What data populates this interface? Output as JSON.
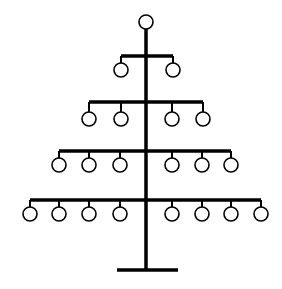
{
  "diagram": {
    "title": "",
    "colors": {
      "line": "#000000",
      "node_fill": "#ffffff",
      "background": "#ffffff"
    },
    "trunk": {
      "x": 146,
      "y_top": 29,
      "y_bottom": 270,
      "width": 3.5
    },
    "base": {
      "x1": 117,
      "x2": 178,
      "y": 270,
      "width": 3.5
    },
    "node_radius": 7,
    "stub_width": 2,
    "bar_width": 3.5,
    "root": {
      "x": 146,
      "y": 22
    },
    "tiers": [
      {
        "name": "tier-1",
        "bar_y": 56,
        "node_y": 70,
        "nodes_x": [
          121,
          173
        ]
      },
      {
        "name": "tier-2",
        "bar_y": 102,
        "node_y": 119,
        "nodes_x": [
          89,
          121,
          172,
          203
        ]
      },
      {
        "name": "tier-3",
        "bar_y": 151,
        "node_y": 165,
        "nodes_x": [
          59,
          89,
          120,
          172,
          202,
          231
        ]
      },
      {
        "name": "tier-4",
        "bar_y": 200,
        "node_y": 214,
        "nodes_x": [
          30,
          59,
          89,
          120,
          172,
          202,
          231,
          261
        ]
      }
    ]
  }
}
